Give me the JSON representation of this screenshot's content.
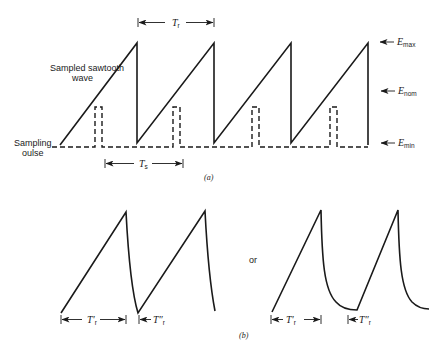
{
  "figure": {
    "part_a": {
      "caption": "(a)",
      "labels": {
        "sawtooth_line1": "Sampled sawtooth",
        "sawtooth_line2": "wave",
        "pulse_line1": "Sampling",
        "pulse_line2": "oulse",
        "tr": "T",
        "tr_sub": "r",
        "ts": "T",
        "ts_sub": "s",
        "emax": "E",
        "emax_sub": "max",
        "enom": "E",
        "enom_sub": "nom",
        "emin": "E",
        "emin_sub": "min"
      }
    },
    "part_b": {
      "caption": "(b)",
      "separator": "or",
      "left": {
        "t1": "T′",
        "t1_sub": "r",
        "t2": "T″",
        "t2_sub": "r"
      },
      "right": {
        "t1": "T′",
        "t1_sub": "r",
        "t2": "T″",
        "t2_sub": "r"
      }
    }
  }
}
